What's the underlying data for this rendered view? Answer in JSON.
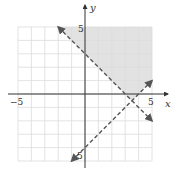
{
  "chart_data": {
    "type": "line",
    "title": "",
    "xlabel": "x",
    "ylabel": "y",
    "xlim": [
      -5,
      5
    ],
    "ylim": [
      -5,
      5
    ],
    "grid": true,
    "tick_labels": {
      "x": [
        "-5",
        "5"
      ],
      "y": [
        "5",
        "-5"
      ]
    },
    "series": [
      {
        "name": "boundary 1",
        "equation": "y = -x + 3",
        "style": "dashed",
        "x": [
          -2,
          5
        ],
        "y": [
          5,
          -2
        ]
      },
      {
        "name": "boundary 2",
        "equation": "y = x - 4",
        "style": "dashed",
        "x": [
          -1,
          5
        ],
        "y": [
          -5,
          1
        ]
      }
    ],
    "shaded_region": {
      "description": "y > -x + 3 and y > x - 4",
      "vertices": [
        [
          -2,
          5
        ],
        [
          5,
          5
        ],
        [
          5,
          1
        ],
        [
          3.5,
          -0.5
        ]
      ],
      "color": "#e2e2e2"
    },
    "colors": {
      "shade": "#e2e2e2",
      "grid": "#dcdcdc",
      "axis": "#333333",
      "line": "#555555"
    }
  },
  "labels": {
    "x_axis": "x",
    "y_axis": "y",
    "x_min": "−5",
    "x_max": "5",
    "y_max": "5",
    "y_min": "5"
  }
}
